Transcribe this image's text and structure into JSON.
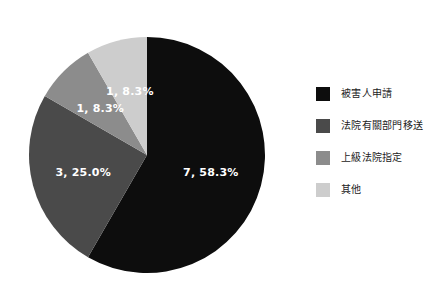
{
  "chart_data": {
    "type": "pie",
    "title": "",
    "subtitle": "",
    "xlabel": "",
    "ylabel": "",
    "grid": false,
    "legend_position": "right",
    "total": 12,
    "start_angle_deg": 0,
    "direction": "clockwise",
    "categories": [
      "被害人申請",
      "法院有關部門移送",
      "上級法院指定",
      "其他"
    ],
    "values": [
      7,
      3,
      1,
      1
    ],
    "percents": [
      "58.3%",
      "25.0%",
      "8.3%",
      "8.3%"
    ],
    "colors": [
      "#0d0d0d",
      "#4a4a4a",
      "#8c8c8c",
      "#cdcdcd"
    ],
    "slices": [
      {
        "label": "被害人申請",
        "value": 7,
        "percent": "58.3%",
        "percent_value": 58.3,
        "data_label": "7, 58.3%",
        "color": "#0d0d0d",
        "label_color": "#ffffff"
      },
      {
        "label": "法院有關部門移送",
        "value": 3,
        "percent": "25.0%",
        "percent_value": 25.0,
        "data_label": "3, 25.0%",
        "color": "#4a4a4a",
        "label_color": "#ffffff"
      },
      {
        "label": "上級法院指定",
        "value": 1,
        "percent": "8.3%",
        "percent_value": 8.3,
        "data_label": "1, 8.3%",
        "color": "#8c8c8c",
        "label_color": "#ffffff"
      },
      {
        "label": "其他",
        "value": 1,
        "percent": "8.3%",
        "percent_value": 8.3,
        "data_label": "1, 8.3%",
        "color": "#cdcdcd",
        "label_color": "#ffffff"
      }
    ]
  },
  "legend": {
    "items": [
      {
        "label": "被害人申請",
        "color": "#0d0d0d"
      },
      {
        "label": "法院有關部門移送",
        "color": "#4a4a4a"
      },
      {
        "label": "上級法院指定",
        "color": "#8c8c8c"
      },
      {
        "label": "其他",
        "color": "#cdcdcd"
      }
    ]
  },
  "background": "#ffffff"
}
